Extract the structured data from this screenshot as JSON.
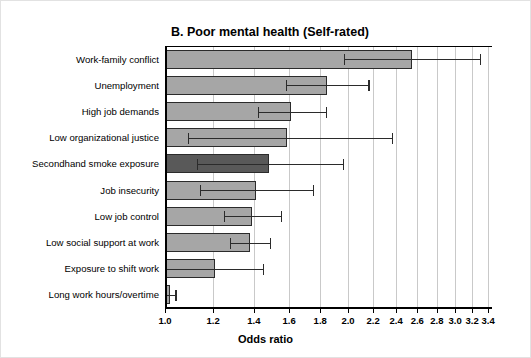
{
  "chart_data": {
    "type": "bar",
    "orientation": "horizontal",
    "title": "B. Poor mental health (Self-rated)",
    "xlabel": "Odds ratio",
    "ylabel": "",
    "scale": "log",
    "grid": true,
    "legend": false,
    "xlim": [
      1.0,
      3.45
    ],
    "xticks": [
      "1.0",
      "1.2",
      "1.4",
      "1.6",
      "1.8",
      "2.0",
      "2.2",
      "2.4",
      "2.6",
      "2.8",
      "3.0",
      "3.2",
      "3.4"
    ],
    "xtick_values": [
      1.0,
      1.2,
      1.4,
      1.6,
      1.8,
      2.0,
      2.2,
      2.4,
      2.6,
      2.8,
      3.0,
      3.2,
      3.4
    ],
    "categories": [
      "Work-family conflict",
      "Unemployment",
      "High job demands",
      "Low organizational justice",
      "Secondhand smoke exposure",
      "Job insecurity",
      "Low job control",
      "Low social support at work",
      "Exposure to shift work",
      "Long work hours/overtime"
    ],
    "values": [
      2.55,
      1.85,
      1.61,
      1.59,
      1.48,
      1.41,
      1.39,
      1.38,
      1.21,
      1.02
    ],
    "ci_lower": [
      1.97,
      1.58,
      1.42,
      1.09,
      1.13,
      1.14,
      1.25,
      1.28,
      1.0,
      1.0
    ],
    "ci_upper": [
      3.3,
      2.16,
      1.84,
      2.36,
      1.96,
      1.75,
      1.55,
      1.49,
      1.45,
      1.04
    ],
    "highlight_index": 4,
    "colors": {
      "bar": "#a6a6a6",
      "bar_highlight": "#595959",
      "bar_border": "#2b2b2b",
      "grid": "#c9c9c9",
      "axis": "#000000",
      "text": "#000000",
      "background": "#ffffff",
      "figure_border": "#e2e2e2"
    }
  }
}
